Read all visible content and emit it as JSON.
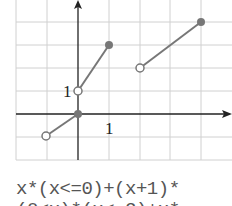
{
  "graph": {
    "x_label": "1",
    "y_label": "1",
    "colors": {
      "grid": "#d0d0d0",
      "axis": "#222222",
      "line": "#777777",
      "point": "#777777"
    },
    "segments": [
      {
        "from": [
          46,
          136
        ],
        "to": [
          78,
          114
        ],
        "start": "open",
        "end": "filled"
      },
      {
        "from": [
          78,
          91
        ],
        "to": [
          109,
          45
        ],
        "start": "open",
        "end": "filled"
      },
      {
        "from": [
          140,
          68
        ],
        "to": [
          201,
          22
        ],
        "start": "open",
        "end": "filled"
      }
    ]
  },
  "formula": {
    "line1": "x*(x<=0)+(x+1)*",
    "line2": "(0<x)*(x<=2)+x*"
  }
}
